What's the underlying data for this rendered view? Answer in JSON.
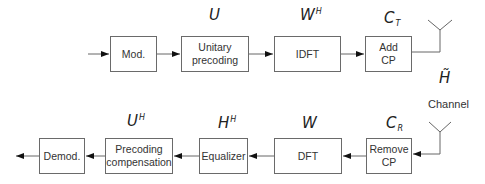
{
  "diagram": {
    "type": "block-diagram",
    "title": "",
    "transmitter": {
      "blocks": [
        {
          "id": "mod",
          "label": "Mod.",
          "symbol": ""
        },
        {
          "id": "unitary",
          "label": "Unitary precoding",
          "symbol": "U",
          "sup": "",
          "sub": ""
        },
        {
          "id": "idft",
          "label": "IDFT",
          "symbol": "W",
          "sup": "H",
          "sub": ""
        },
        {
          "id": "addcp",
          "label": "Add CP",
          "symbol": "C",
          "sup": "",
          "sub": "T"
        }
      ]
    },
    "channel": {
      "symbol": "H̃",
      "label": "Channel"
    },
    "receiver": {
      "blocks": [
        {
          "id": "removecp",
          "label": "Remove CP",
          "symbol": "C",
          "sup": "",
          "sub": "R"
        },
        {
          "id": "dft",
          "label": "DFT",
          "symbol": "W",
          "sup": "",
          "sub": ""
        },
        {
          "id": "equalizer",
          "label": "Equalizer",
          "symbol": "H",
          "sup": "H",
          "sub": ""
        },
        {
          "id": "precomp",
          "label": "Precoding compensation",
          "symbol": "U",
          "sup": "H",
          "sub": ""
        },
        {
          "id": "demod",
          "label": "Demod.",
          "symbol": ""
        }
      ]
    },
    "labels": {
      "mod_l1": "Mod.",
      "unitary_l1": "Unitary",
      "unitary_l2": "precoding",
      "idft_l1": "IDFT",
      "addcp_l1": "Add",
      "addcp_l2": "CP",
      "removecp_l1": "Remove",
      "removecp_l2": "CP",
      "dft_l1": "DFT",
      "equalizer_l1": "Equalizer",
      "precomp_l1": "Precoding",
      "precomp_l2": "compensation",
      "demod_l1": "Demod.",
      "channel": "Channel",
      "channel_sym": "H̃",
      "sym_U": "U",
      "sym_W": "W",
      "sym_WH_sup": "H",
      "sym_C": "C",
      "sym_CT_sub": "T",
      "sym_CR_sub": "R",
      "sym_H": "H",
      "sym_HH_sup": "H",
      "sym_UH_sup": "H"
    }
  }
}
